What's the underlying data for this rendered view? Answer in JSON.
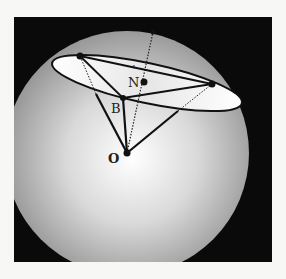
{
  "figure": {
    "labels": {
      "N": "N",
      "B": "B",
      "O": "O"
    },
    "colors": {
      "background_box": "#0a0a0a",
      "sphere_light": "#ffffff",
      "sphere_dark": "#8c8c8c",
      "ellipse_fill": "#f4f4f4",
      "stroke": "#111111",
      "page": "#f7f7f5"
    },
    "points": {
      "O": [
        127,
        153
      ],
      "N": [
        144,
        82
      ],
      "B": [
        123,
        98
      ],
      "P_left": [
        80,
        56
      ],
      "P_right": [
        212,
        84
      ],
      "P_top": [
        153,
        32
      ]
    }
  }
}
